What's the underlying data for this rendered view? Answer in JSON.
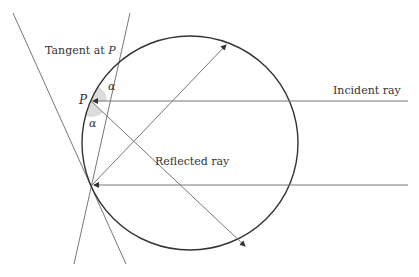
{
  "labels": {
    "tangent": "Tangent at ",
    "tangent_point": "P",
    "point": "P",
    "alpha_top": "α",
    "alpha_bottom": "α",
    "incident": "Incident ray",
    "reflected": "Reflected ray"
  },
  "colors": {
    "circle": "#333333",
    "line": "#777777",
    "angle_fill": "#d9d9d9"
  }
}
